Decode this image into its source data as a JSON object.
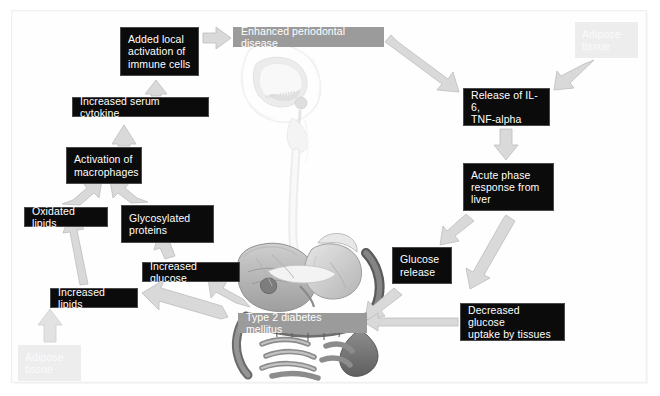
{
  "figure": {
    "background_illustration": "human-anatomy-head-neck-and-abdominal-organs"
  },
  "nodes": [
    {
      "id": "added-local-activation",
      "label": "Added local\nactivation of\nimmune cells",
      "style": "dark",
      "x": 120,
      "y": 27,
      "w": 79,
      "h": 49
    },
    {
      "id": "enhanced-periodontal-disease",
      "label": "Enhanced periodontal disease",
      "style": "gray",
      "x": 233,
      "y": 27,
      "w": 151,
      "h": 20
    },
    {
      "id": "adipose-tissue-top",
      "label": "Adipose\ntissue",
      "style": "ghost",
      "x": 575,
      "y": 22,
      "w": 63,
      "h": 36
    },
    {
      "id": "increased-serum-cytokine",
      "label": "Increased serum cytokine",
      "style": "dark",
      "x": 72,
      "y": 97,
      "w": 137,
      "h": 20
    },
    {
      "id": "release-of-il6",
      "label": "Release of IL-6,\nTNF-alpha",
      "style": "dark",
      "x": 463,
      "y": 88,
      "w": 87,
      "h": 38
    },
    {
      "id": "activation-of-macrophages",
      "label": "Activation of\nmacrophages",
      "style": "dark",
      "x": 66,
      "y": 147,
      "w": 76,
      "h": 37
    },
    {
      "id": "acute-phase-response",
      "label": "Acute phase\nresponse from\nliver",
      "style": "dark",
      "x": 463,
      "y": 163,
      "w": 91,
      "h": 48
    },
    {
      "id": "oxidated-lipids",
      "label": "Oxidated lipids",
      "style": "dark",
      "x": 24,
      "y": 207,
      "w": 84,
      "h": 20
    },
    {
      "id": "glycosylated-proteins",
      "label": "Glycosylated\nproteins",
      "style": "dark",
      "x": 121,
      "y": 205,
      "w": 93,
      "h": 38
    },
    {
      "id": "increased-glucose",
      "label": "Increased glucose",
      "style": "dark",
      "x": 142,
      "y": 262,
      "w": 98,
      "h": 20
    },
    {
      "id": "glucose-release",
      "label": "Glucose\nrelease",
      "style": "dark",
      "x": 392,
      "y": 247,
      "w": 60,
      "h": 37
    },
    {
      "id": "increased-lipids",
      "label": "Increased lipids",
      "style": "dark",
      "x": 50,
      "y": 288,
      "w": 88,
      "h": 20
    },
    {
      "id": "type-2-diabetes-mellitus",
      "label": "Type 2 diabetes mellitus",
      "style": "gray",
      "x": 238,
      "y": 313,
      "w": 129,
      "h": 20
    },
    {
      "id": "decreased-glucose-uptake",
      "label": "Decreased glucose\nuptake by tissues",
      "style": "dark",
      "x": 460,
      "y": 303,
      "w": 105,
      "h": 38
    },
    {
      "id": "adipose-tissue-bottom",
      "label": "Adipose\ntissue",
      "style": "ghost",
      "x": 18,
      "y": 345,
      "w": 63,
      "h": 36
    }
  ],
  "arrows": [
    {
      "id": "immune-to-periodontal",
      "from": "added-local-activation",
      "to": "enhanced-periodontal-disease",
      "direction": "right"
    },
    {
      "id": "cytokine-to-immune",
      "from": "increased-serum-cytokine",
      "to": "added-local-activation",
      "direction": "up"
    },
    {
      "id": "macrophages-to-cytokine",
      "from": "activation-of-macrophages",
      "to": "increased-serum-cytokine",
      "direction": "up"
    },
    {
      "id": "periodontal-to-release",
      "from": "enhanced-periodontal-disease",
      "to": "release-of-il6",
      "direction": "down-right"
    },
    {
      "id": "adipose-top-to-release",
      "from": "adipose-tissue-top",
      "to": "release-of-il6",
      "direction": "down-left"
    },
    {
      "id": "release-to-acute-phase",
      "from": "release-of-il6",
      "to": "acute-phase-response",
      "direction": "down"
    },
    {
      "id": "acute-phase-to-glucose-release",
      "from": "acute-phase-response",
      "to": "glucose-release",
      "direction": "down-left"
    },
    {
      "id": "acute-phase-to-decreased-uptake",
      "from": "acute-phase-response",
      "to": "decreased-glucose-uptake",
      "direction": "down-left"
    },
    {
      "id": "oxidated-to-macrophages",
      "from": "oxidated-lipids",
      "to": "activation-of-macrophages",
      "direction": "up-right"
    },
    {
      "id": "glycosylated-to-macrophages",
      "from": "glycosylated-proteins",
      "to": "activation-of-macrophages",
      "direction": "up-left"
    },
    {
      "id": "lipids-to-oxidated",
      "from": "increased-lipids",
      "to": "oxidated-lipids",
      "direction": "up"
    },
    {
      "id": "glucose-to-glycosylated",
      "from": "increased-glucose",
      "to": "glycosylated-proteins",
      "direction": "up"
    },
    {
      "id": "diabetes-to-increased-lipids",
      "from": "type-2-diabetes-mellitus",
      "to": "increased-lipids",
      "direction": "up-left"
    },
    {
      "id": "diabetes-to-increased-glucose",
      "from": "type-2-diabetes-mellitus",
      "to": "increased-glucose",
      "direction": "up-left"
    },
    {
      "id": "adipose-bottom-to-lipids",
      "from": "adipose-tissue-bottom",
      "to": "increased-lipids",
      "direction": "up"
    },
    {
      "id": "glucose-release-to-diabetes",
      "from": "glucose-release",
      "to": "type-2-diabetes-mellitus",
      "direction": "down-left"
    },
    {
      "id": "decreased-uptake-to-diabetes",
      "from": "decreased-glucose-uptake",
      "to": "type-2-diabetes-mellitus",
      "direction": "left"
    }
  ],
  "colors": {
    "node_dark_bg": "#0b0b0b",
    "node_dark_text": "#ffffff",
    "node_gray_bg": "#9b9b9b",
    "node_ghost_bg": "#ededed",
    "arrow_fill": "#d9d9d9",
    "arrow_stroke": "#bdbdbd",
    "page_bg": "#ffffff"
  }
}
